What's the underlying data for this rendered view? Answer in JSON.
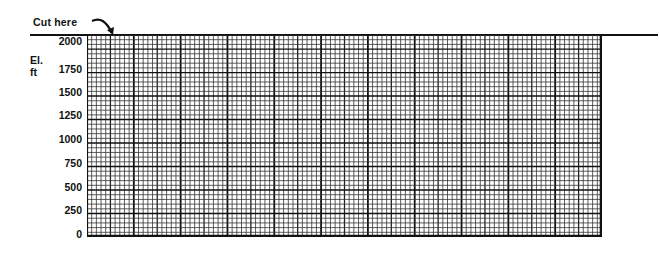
{
  "header": {
    "cut_label": "Cut here",
    "cut_arrow_icon": "curved-arrow-down-right"
  },
  "axis": {
    "title_line1": "El.",
    "title_line2": "ft"
  },
  "chart_data": {
    "type": "grid",
    "ylabel": "El. ft",
    "xlabel": "",
    "ylim": [
      0,
      2000
    ],
    "yticks": [
      2000,
      1750,
      1500,
      1250,
      1000,
      750,
      500,
      250,
      0
    ],
    "grid": {
      "on": true,
      "fine_columns": 110,
      "fine_rows": 43,
      "major_column_every": 10,
      "medium_column_every": 5,
      "major_row_every": 5
    },
    "annotations": [
      "Cut here"
    ]
  },
  "ylabels": [
    {
      "text": "2000",
      "y": 41
    },
    {
      "text": "1750",
      "y": 69
    },
    {
      "text": "1500",
      "y": 92
    },
    {
      "text": "1250",
      "y": 115
    },
    {
      "text": "1000",
      "y": 139
    },
    {
      "text": "750",
      "y": 163
    },
    {
      "text": "500",
      "y": 187
    },
    {
      "text": "250",
      "y": 210
    },
    {
      "text": "0",
      "y": 234
    }
  ]
}
